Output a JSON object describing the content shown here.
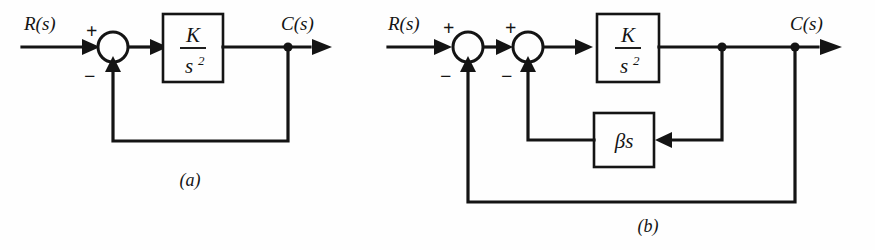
{
  "figure": {
    "background_color": "#fefefe",
    "line_color": "#141414"
  },
  "diagram_a": {
    "caption": "(a)",
    "input_label": "R(s)",
    "output_label": "C(s)",
    "summer": {
      "positive_sign": "+",
      "negative_sign": "−"
    },
    "plant_block": {
      "numerator": "K",
      "denominator_base": "s",
      "denominator_exponent": "2"
    }
  },
  "diagram_b": {
    "caption": "(b)",
    "input_label": "R(s)",
    "output_label": "C(s)",
    "summer_outer": {
      "positive_sign": "+",
      "negative_sign": "−"
    },
    "summer_inner": {
      "positive_sign": "+",
      "negative_sign": "−"
    },
    "plant_block": {
      "numerator": "K",
      "denominator_base": "s",
      "denominator_exponent": "2"
    },
    "feedback_block": {
      "label": "βs"
    }
  }
}
